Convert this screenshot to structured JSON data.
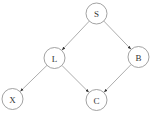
{
  "diagram": {
    "type": "directed-graph",
    "nodes": [
      {
        "id": "S",
        "label": "S",
        "cx": 96.5,
        "cy": 13.5,
        "r": 10.5
      },
      {
        "id": "L",
        "label": "L",
        "cx": 54.5,
        "cy": 58,
        "r": 10.5
      },
      {
        "id": "B",
        "label": "B",
        "cx": 138.5,
        "cy": 57,
        "r": 10.5
      },
      {
        "id": "X",
        "label": "X",
        "cx": 12.5,
        "cy": 99,
        "r": 10.5
      },
      {
        "id": "C",
        "label": "C",
        "cx": 96.5,
        "cy": 100,
        "r": 10.5
      }
    ],
    "edges": [
      {
        "from": "S",
        "to": "L"
      },
      {
        "from": "S",
        "to": "B"
      },
      {
        "from": "L",
        "to": "X"
      },
      {
        "from": "L",
        "to": "C"
      },
      {
        "from": "B",
        "to": "C"
      }
    ],
    "colors": {
      "node_stroke": "#8a8a8a",
      "edge": "#8a8a8a",
      "arrowhead": "#333333",
      "text": "#333333",
      "background": "#ffffff"
    }
  }
}
